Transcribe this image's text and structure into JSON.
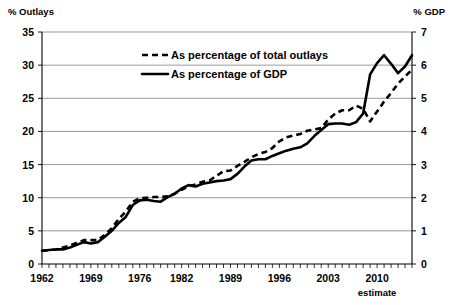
{
  "chart_data": {
    "type": "line",
    "title": "",
    "left_axis": {
      "label": "% Outlays",
      "ticks": [
        0,
        5,
        10,
        15,
        20,
        25,
        30,
        35
      ],
      "range": [
        0,
        35
      ]
    },
    "right_axis": {
      "label": "% GDP",
      "ticks": [
        0,
        1,
        2,
        3,
        4,
        5,
        6,
        7
      ],
      "range": [
        0,
        7
      ]
    },
    "xlabel": "",
    "x_tick_labels": [
      "1962",
      "1969",
      "1976",
      "1982",
      "1989",
      "1996",
      "2003",
      "2010"
    ],
    "x_tick_years": [
      1962,
      1969,
      1976,
      1982,
      1989,
      1996,
      2003,
      2010
    ],
    "x_annotation": "estimate",
    "xlim": [
      1962,
      2015
    ],
    "grid": true,
    "legend_position": "top-center",
    "series": [
      {
        "name": "As percentage of total outlays",
        "style": "dashed",
        "axis": "left",
        "x": [
          1962,
          1963,
          1964,
          1965,
          1966,
          1967,
          1968,
          1969,
          1970,
          1971,
          1972,
          1973,
          1974,
          1975,
          1976,
          1977,
          1978,
          1979,
          1980,
          1981,
          1982,
          1983,
          1984,
          1985,
          1986,
          1987,
          1988,
          1989,
          1990,
          1991,
          1992,
          1993,
          1994,
          1995,
          1996,
          1997,
          1998,
          1999,
          2000,
          2001,
          2002,
          2003,
          2004,
          2005,
          2006,
          2007,
          2008,
          2009,
          2010,
          2011,
          2012,
          2013,
          2014,
          2015
        ],
        "values": [
          2.0,
          2.1,
          2.2,
          2.5,
          2.8,
          3.2,
          3.6,
          3.6,
          3.6,
          4.4,
          5.4,
          6.8,
          7.9,
          9.4,
          9.9,
          10.0,
          10.1,
          10.1,
          10.2,
          10.6,
          11.2,
          11.7,
          12.0,
          12.4,
          12.6,
          13.3,
          14.0,
          14.1,
          14.8,
          15.4,
          16.1,
          16.6,
          16.9,
          17.5,
          18.5,
          19.1,
          19.4,
          19.6,
          20.1,
          20.3,
          20.5,
          21.8,
          22.7,
          23.2,
          23.2,
          23.9,
          23.4,
          21.5,
          23.0,
          24.5,
          25.8,
          27.2,
          28.3,
          29.3
        ]
      },
      {
        "name": "As percentage of GDP",
        "style": "solid",
        "axis": "right",
        "x": [
          1962,
          1963,
          1964,
          1965,
          1966,
          1967,
          1968,
          1969,
          1970,
          1971,
          1972,
          1973,
          1974,
          1975,
          1976,
          1977,
          1978,
          1979,
          1980,
          1981,
          1982,
          1983,
          1984,
          1985,
          1986,
          1987,
          1988,
          1989,
          1990,
          1991,
          1992,
          1993,
          1994,
          1995,
          1996,
          1997,
          1998,
          1999,
          2000,
          2001,
          2002,
          2003,
          2004,
          2005,
          2006,
          2007,
          2008,
          2009,
          2010,
          2011,
          2012,
          2013,
          2014,
          2015
        ],
        "values": [
          0.4,
          0.42,
          0.44,
          0.44,
          0.5,
          0.58,
          0.66,
          0.62,
          0.66,
          0.82,
          1.0,
          1.24,
          1.42,
          1.78,
          1.92,
          1.94,
          1.9,
          1.88,
          2.02,
          2.12,
          2.28,
          2.38,
          2.34,
          2.42,
          2.46,
          2.5,
          2.52,
          2.56,
          2.72,
          2.94,
          3.12,
          3.16,
          3.16,
          3.26,
          3.34,
          3.42,
          3.48,
          3.52,
          3.64,
          3.86,
          4.04,
          4.22,
          4.24,
          4.24,
          4.2,
          4.28,
          4.54,
          5.72,
          6.06,
          6.3,
          6.04,
          5.76,
          5.96,
          6.3
        ]
      }
    ]
  },
  "legend": {
    "items": [
      {
        "label": "As percentage of total outlays",
        "style": "dashed"
      },
      {
        "label": "As percentage of GDP",
        "style": "solid"
      }
    ]
  }
}
